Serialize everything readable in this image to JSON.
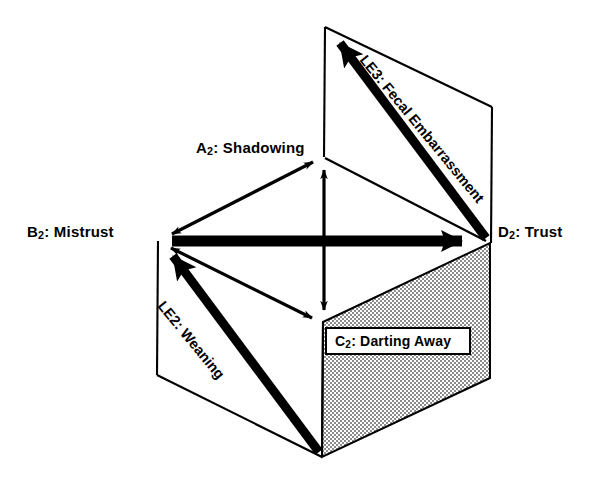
{
  "figure": {
    "background_color": "#ffffff",
    "line_color": "#000000",
    "shaded_face_color": "#a8a8a8",
    "width": 603,
    "height": 483
  },
  "vertices": {
    "A2": {
      "label_prefix": "A",
      "subscript": "2",
      "text": ": Shadowing",
      "full": "A2: Shadowing",
      "x": 323,
      "y": 157
    },
    "B2": {
      "label_prefix": "B",
      "subscript": "2",
      "text": ": Mistrust",
      "full": "B2: Mistrust",
      "x": 159,
      "y": 241
    },
    "C2": {
      "label_prefix": "C",
      "subscript": "2",
      "text": ": Darting Away",
      "full": "C2: Darting Away",
      "x": 323,
      "y": 322
    },
    "D2": {
      "label_prefix": "D",
      "subscript": "2",
      "text": ": Trust",
      "full": "D2: Trust",
      "x": 490,
      "y": 242
    }
  },
  "labels": {
    "a2": {
      "prefix": "A",
      "sub": "2",
      "rest": ": Shadowing"
    },
    "b2": {
      "prefix": "B",
      "sub": "2",
      "rest": ": Mistrust"
    },
    "c2": {
      "prefix": "C",
      "sub": "2",
      "rest": ": Darting Away"
    },
    "d2": {
      "prefix": "D",
      "sub": "2",
      "rest": ": Trust"
    },
    "le2": {
      "prefix": "LE",
      "sub": "2",
      "rest": ": Weaning"
    },
    "le3": {
      "prefix": "LE",
      "sub": "3",
      "rest": ": Fecal Embarrassment"
    }
  },
  "arrows": {
    "le3": {
      "name": "LE3: Fecal Embarrassment",
      "from": "D2",
      "to": "top-vertex",
      "style": "thick-single-headed",
      "head_at": "to"
    },
    "le2": {
      "name": "LE2: Weaning",
      "from": "bottom-vertex",
      "to": "B2",
      "style": "thick-single-headed",
      "head_at": "to"
    },
    "mistrust_trust": {
      "name": "B2 to D2 axis",
      "from": "B2",
      "to": "D2",
      "style": "thick-single-headed",
      "head_at": "to"
    },
    "shadowing_mistrust": {
      "name": "A2 to B2",
      "from": "A2",
      "to": "B2",
      "style": "thin-double-headed"
    },
    "shadowing_darting": {
      "name": "A2 to C2 vertical",
      "from": "A2",
      "to": "C2",
      "style": "thin-double-headed"
    },
    "mistrust_darting": {
      "name": "B2 to C2",
      "from": "B2",
      "to": "C2",
      "style": "thin-double-headed"
    },
    "shadowing_trust": {
      "name": "A2 to D2",
      "from": "A2",
      "to": "D2",
      "style": "thin-line"
    }
  }
}
